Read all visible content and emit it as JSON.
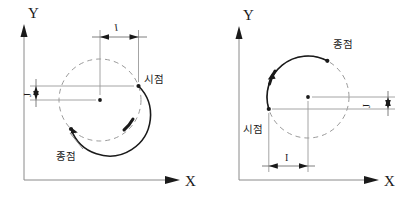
{
  "figure": {
    "title": "",
    "background_color": "#ffffff",
    "axis_color": "#8a8a8a",
    "arc_color": "#1a1a1a",
    "dashed_circle_color": "#9a9a9a"
  },
  "diagrams": [
    {
      "id": "left",
      "axis_x_label": "X",
      "axis_y_label": "Y",
      "start_point_label": "시점",
      "end_point_label": "종점",
      "dim_i_label": "I",
      "dim_j_label": "J",
      "direction": "clockwise",
      "start_angle_deg": 20,
      "end_angle_deg": 225
    },
    {
      "id": "right",
      "axis_x_label": "X",
      "axis_y_label": "Y",
      "start_point_label": "시점",
      "end_point_label": "종점",
      "dim_i_label": "I",
      "dim_j_label": "J",
      "direction": "counterclockwise",
      "start_angle_deg": 197,
      "end_angle_deg": 62
    }
  ]
}
